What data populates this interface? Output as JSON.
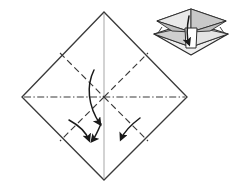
{
  "figure": {
    "canvas": {
      "width": 236,
      "height": 194,
      "background": "#ffffff"
    },
    "colors": {
      "outline": "#3a3a3a",
      "crease_dashed": "#3a3a3a",
      "crease_dashdot": "#3a3a3a",
      "center_line": "#c8c8c8",
      "arrow": "#1a1a1a",
      "inset_outline": "#2b2b2b",
      "inset_fill_light": "#f2f2f2",
      "inset_fill_mid": "#d6d6d6",
      "inset_fill_dark": "#b4b4b4",
      "paper_fill": "#ffffff"
    },
    "main_shape": {
      "name": "diamond-square-sheet",
      "vertices": [
        {
          "label": "top",
          "x": 104,
          "y": 12
        },
        {
          "label": "right",
          "x": 187,
          "y": 97
        },
        {
          "label": "bottom",
          "x": 104,
          "y": 180
        },
        {
          "label": "left",
          "x": 22,
          "y": 97
        }
      ],
      "center": {
        "x": 104,
        "y": 97
      }
    },
    "creases": [
      {
        "name": "vertical-center-line",
        "style": "solid-light",
        "from": {
          "x": 104,
          "y": 14
        },
        "to": {
          "x": 104,
          "y": 178
        }
      },
      {
        "name": "horizontal-dashdot-crease",
        "style": "dash-dot",
        "from": {
          "x": 24,
          "y": 97
        },
        "to": {
          "x": 185,
          "y": 97
        }
      },
      {
        "name": "diagonal-crease-upper-left",
        "style": "dashed",
        "from": {
          "x": 60,
          "y": 53
        },
        "to": {
          "x": 104,
          "y": 97
        }
      },
      {
        "name": "diagonal-crease-upper-right",
        "style": "dashed",
        "from": {
          "x": 104,
          "y": 97
        },
        "to": {
          "x": 148,
          "y": 53
        }
      },
      {
        "name": "diagonal-crease-lower-left",
        "style": "dashed",
        "from": {
          "x": 104,
          "y": 97
        },
        "to": {
          "x": 60,
          "y": 141
        }
      },
      {
        "name": "diagonal-crease-lower-right",
        "style": "dashed",
        "from": {
          "x": 104,
          "y": 97
        },
        "to": {
          "x": 148,
          "y": 141
        }
      }
    ],
    "arrows": [
      {
        "name": "fold-arrow-center",
        "description": "long curved arrow sweeping from upper-left through center down to bottom centre",
        "path": "M 94 70 C 86 86, 88 106, 100 124",
        "head_at": {
          "x": 100,
          "y": 124
        },
        "head_angle": 57
      },
      {
        "name": "fold-arrow-lower-left-outer",
        "description": "short curved arrow on lower-left crease pointing down-right",
        "path": "M 69 120 C 80 126, 86 132, 89 140",
        "head_at": {
          "x": 89,
          "y": 140
        },
        "head_angle": 70
      },
      {
        "name": "fold-arrow-lower-left-inner",
        "description": "short straight-ish arrow below centre pointing down",
        "path": "M 101 124 C 98 130, 96 136, 92 141",
        "head_at": {
          "x": 92,
          "y": 141
        },
        "head_angle": 128
      },
      {
        "name": "fold-arrow-lower-right",
        "description": "short curved arrow on lower-right crease pointing down-left",
        "path": "M 140 118 C 132 124, 125 130, 121 139",
        "head_at": {
          "x": 121,
          "y": 139
        },
        "head_angle": 115
      }
    ],
    "inset": {
      "name": "result-preview-3d",
      "description": "Three-dimensional preview of the folded model: two stacked flat square flaps with a downward arrow collapsing them together",
      "bounds": {
        "x": 150,
        "y": 6,
        "width": 78,
        "height": 50
      },
      "arrow": {
        "name": "inset-collapse-arrow",
        "description": "arrow pointing down inside the model",
        "direction": "down"
      }
    }
  }
}
